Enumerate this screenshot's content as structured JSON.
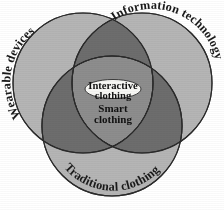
{
  "diagram": {
    "type": "venn-3-circle",
    "background_color": "#ffffff",
    "circle_fill_color": "#b5b5b5",
    "pair_overlap_color": "#6d6d6d",
    "triple_overlap_color": "#8d8d8d",
    "outline_color": "#2b2b2b",
    "center_ellipse_color": "#f7f7f4",
    "sets": [
      {
        "id": "wearable-devices",
        "label": "Wearable devices",
        "position": "top-left"
      },
      {
        "id": "information-technology",
        "label": "Information technology",
        "position": "top-right"
      },
      {
        "id": "traditional-clothing",
        "label": "Traditional clothing",
        "position": "bottom"
      }
    ],
    "intersection": {
      "primary_label": "Interactive clothing",
      "primary_line_1": "Interactive",
      "primary_line_2": "clothing",
      "secondary_line_1": "Smart",
      "secondary_line_2": "clothing",
      "secondary_label": "Smart clothing"
    }
  }
}
